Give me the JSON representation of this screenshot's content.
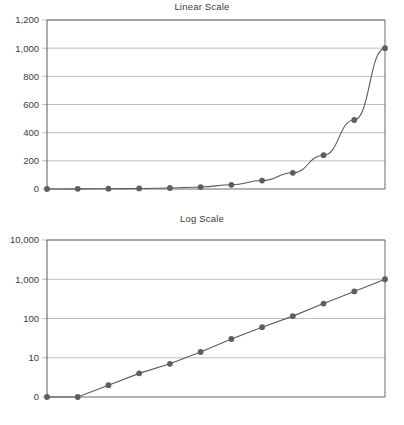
{
  "chart_data": [
    {
      "type": "line",
      "title": "Linear Scale",
      "xlabel": "",
      "ylabel": "",
      "yscale": "linear",
      "ylim": [
        0,
        1200
      ],
      "yticks": [
        0,
        200,
        400,
        600,
        800,
        1000,
        1200
      ],
      "ytick_labels": [
        "0",
        "200",
        "400",
        "600",
        "800",
        "1,000",
        "1,200"
      ],
      "grid": true,
      "legend": false,
      "x": [
        1,
        2,
        3,
        4,
        5,
        6,
        7,
        8,
        9,
        10,
        11,
        12
      ],
      "values": [
        1,
        2,
        4,
        7,
        14,
        30,
        60,
        115,
        240,
        490,
        1000
      ],
      "series": [
        {
          "name": "series-1",
          "values": [
            0,
            1,
            2,
            4,
            7,
            14,
            30,
            60,
            115,
            240,
            490,
            1000
          ]
        }
      ],
      "marker": "circle",
      "line_color": "#5a5a5a",
      "marker_color": "#5e5e5e"
    },
    {
      "type": "line",
      "title": "Log Scale",
      "xlabel": "",
      "ylabel": "",
      "yscale": "log",
      "ylim": [
        0,
        10000
      ],
      "yticks": [
        0,
        10,
        100,
        1000,
        10000
      ],
      "ytick_labels": [
        "0",
        "10",
        "100",
        "1,000",
        "10,000"
      ],
      "grid": true,
      "legend": false,
      "x": [
        1,
        2,
        3,
        4,
        5,
        6,
        7,
        8,
        9,
        10,
        11,
        12
      ],
      "values": [
        1,
        2,
        4,
        7,
        14,
        30,
        60,
        115,
        240,
        490,
        1000
      ],
      "series": [
        {
          "name": "series-1",
          "values": [
            0,
            1,
            2,
            4,
            7,
            14,
            30,
            60,
            115,
            240,
            490,
            1000
          ]
        }
      ],
      "marker": "circle",
      "line_color": "#5a5a5a",
      "marker_color": "#5e5e5e"
    }
  ],
  "linear_chart": {
    "title": "Linear Scale",
    "ytick_labels": [
      "1,200",
      "1,000",
      "800",
      "600",
      "400",
      "200",
      "0"
    ]
  },
  "log_chart": {
    "title": "Log Scale",
    "ytick_labels": [
      "10,000",
      "1,000",
      "100",
      "10",
      "0"
    ]
  },
  "colors": {
    "line": "#5a5a5a",
    "marker": "#5e5e5e",
    "grid": "#b6b6b6",
    "axis": "#5a5a5a",
    "text": "#3c3c3c",
    "background": "#ffffff"
  }
}
